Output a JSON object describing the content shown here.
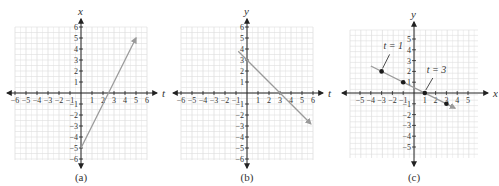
{
  "colors": {
    "axis": "#222222",
    "grid": "#dedede",
    "line": "#9a9a9a",
    "point": "#1a1a1a",
    "text": "#333333"
  },
  "chart_data": [
    {
      "type": "line",
      "caption": "(a)",
      "xlabel": "t",
      "ylabel": "x",
      "xlim": [
        -6,
        6
      ],
      "ylim": [
        -6,
        6
      ],
      "xticks": [
        -6,
        -5,
        -4,
        -3,
        -2,
        -1,
        1,
        2,
        3,
        4,
        5,
        6
      ],
      "yticks": [
        -6,
        -5,
        -4,
        -3,
        -2,
        -1,
        1,
        2,
        3,
        4,
        5,
        6
      ],
      "grid": true,
      "series": [
        {
          "name": "x = 2t - 5",
          "x": [
            0,
            5
          ],
          "y": [
            -5,
            5
          ],
          "arrow_end": true
        }
      ]
    },
    {
      "type": "line",
      "caption": "(b)",
      "xlabel": "t",
      "ylabel": "y",
      "xlim": [
        -6,
        6
      ],
      "ylim": [
        -6,
        6
      ],
      "xticks": [
        -6,
        -5,
        -4,
        -3,
        -2,
        -1,
        1,
        2,
        3,
        4,
        5,
        6
      ],
      "yticks": [
        -6,
        -5,
        -4,
        -3,
        -2,
        -1,
        1,
        2,
        3,
        4,
        5,
        6
      ],
      "grid": true,
      "series": [
        {
          "name": "y = 3 - t",
          "x": [
            -0.8,
            5.8
          ],
          "y": [
            3.8,
            -2.8
          ],
          "arrow_end": true
        }
      ]
    },
    {
      "type": "scatter",
      "caption": "(c)",
      "xlabel": "x",
      "ylabel": "y",
      "xlim": [
        -6,
        6
      ],
      "ylim": [
        -6,
        6
      ],
      "xticks": [
        -5,
        -4,
        -3,
        -2,
        -1,
        1,
        2,
        3,
        4,
        5
      ],
      "yticks": [
        -5,
        -4,
        -3,
        -2,
        -1,
        1,
        2,
        3,
        4,
        5
      ],
      "grid": true,
      "series": [
        {
          "name": "parametric line",
          "x": [
            -4,
            3.8
          ],
          "y": [
            2.5,
            -1.4
          ],
          "arrow_end": true
        },
        {
          "name": "points",
          "x": [
            -3,
            -1,
            1,
            3
          ],
          "y": [
            2,
            1,
            0,
            -1
          ]
        }
      ],
      "annotations": [
        {
          "text": "t = 1",
          "x": -3,
          "y": 2
        },
        {
          "text": "t = 3",
          "x": 1,
          "y": 0
        }
      ]
    }
  ]
}
